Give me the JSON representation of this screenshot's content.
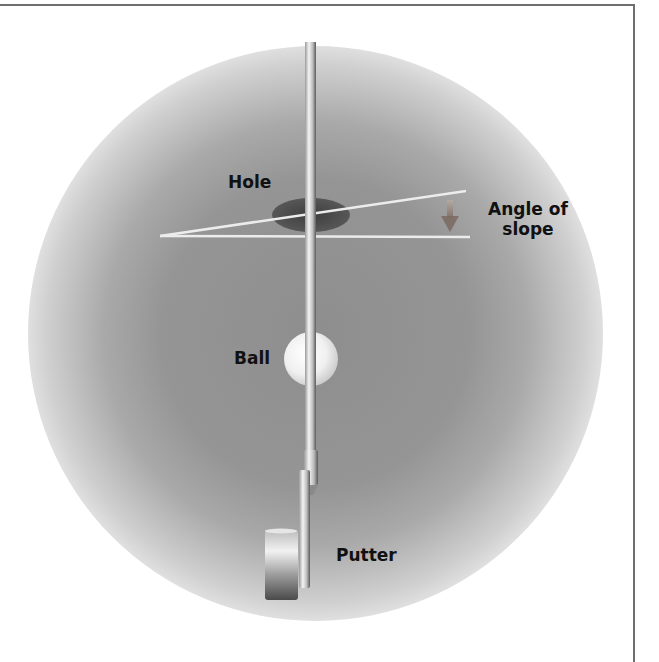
{
  "diagram": {
    "labels": {
      "hole": "Hole",
      "angle_line1": "Angle of",
      "angle_line2": "slope",
      "ball": "Ball",
      "putter": "Putter"
    },
    "elements": [
      "putting-green",
      "hole",
      "slope-line",
      "horizontal-reference-line",
      "angle-arrow",
      "putter-shaft",
      "golf-ball",
      "putter-head"
    ],
    "colors": {
      "green_center": "#8e8e8e",
      "background": "#ffffff",
      "hole": "#4a4a4a",
      "lines": "#e8e8e8",
      "arrow": "#8a7a70",
      "frame": "#6e6e6e"
    }
  }
}
